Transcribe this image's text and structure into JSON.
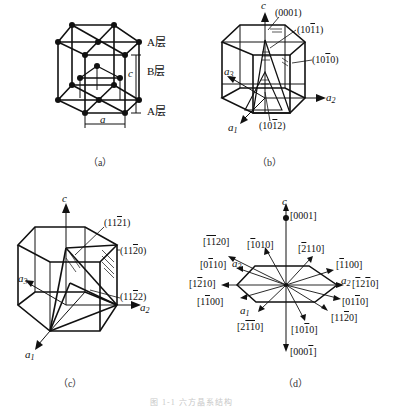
{
  "panels": {
    "a": {
      "caption": "（a）",
      "layers": [
        "A层",
        "B层",
        "A层"
      ],
      "axis_c": "c",
      "axis_a": "a"
    },
    "b": {
      "caption": "（b）",
      "axes": {
        "c": "c",
        "a1": "a",
        "a1_sub": "1",
        "a2": "a",
        "a2_sub": "2",
        "a3": "a",
        "a3_sub": "3"
      },
      "planes": [
        "(0001)",
        "(10̄1̄1)",
        "(101̄0)",
        "(101̄2)"
      ],
      "plane_parts": {
        "p0001": "(0001)",
        "p1011_a": "(10",
        "p1011_b": "1",
        "p1011_c": "1)",
        "p1010_a": "(10",
        "p1010_b": "1",
        "p1010_c": "0)",
        "p1012_a": "(10",
        "p1012_b": "1",
        "p1012_c": "2)"
      }
    },
    "c": {
      "caption": "（c）",
      "axes": {
        "c": "c",
        "a1": "a",
        "a1_sub": "1",
        "a2": "a",
        "a2_sub": "2",
        "a3": "a",
        "a3_sub": "3"
      },
      "plane_parts": {
        "p1121_a": "(11",
        "p1121_b": "2",
        "p1121_c": "1)",
        "p1120_a": "(11",
        "p1120_b": "2",
        "p1120_c": "0)",
        "p1122_a": "(11",
        "p1122_b": "2",
        "p1122_c": "2)"
      }
    },
    "d": {
      "caption": "（d）",
      "axes": {
        "c": "c",
        "a1": "a",
        "a1_sub": "1",
        "a2": "a",
        "a2_sub": "2",
        "a3": "a",
        "a3_sub": "3"
      },
      "directions": [
        {
          "id": "0001",
          "pre": "[0001]",
          "bar": "",
          "post": ""
        },
        {
          "id": "-1-120",
          "pre": "[",
          "bar": "11",
          "post": "20]"
        },
        {
          "id": "-1010",
          "pre": "[",
          "bar": "1",
          "post": "010]"
        },
        {
          "id": "-2110",
          "pre": "[",
          "bar": "2",
          "post": "110]"
        },
        {
          "id": "0-110",
          "pre": "[0",
          "bar": "1",
          "post": "10]"
        },
        {
          "id": "-1100",
          "pre": "[",
          "bar": "1",
          "post": "100]"
        },
        {
          "id": "1-210",
          "pre": "[1",
          "bar": "2",
          "post": "10]"
        },
        {
          "id": "-12-10",
          "pre": "[",
          "bar": "1",
          "post": "2"
        },
        {
          "id": "1-100",
          "pre": "[1",
          "bar": "1",
          "post": "00]"
        },
        {
          "id": "01-10",
          "pre": "[01",
          "bar": "1",
          "post": "0]"
        },
        {
          "id": "2-1-10",
          "pre": "[2",
          "bar": "11",
          "post": "0]"
        },
        {
          "id": "10-10",
          "pre": "[10",
          "bar": "1",
          "post": "0]"
        },
        {
          "id": "11-20",
          "pre": "[11",
          "bar": "2",
          "post": "0]"
        },
        {
          "id": "000-1",
          "pre": "[000",
          "bar": "1",
          "post": "]"
        }
      ]
    }
  },
  "figure_caption": "图 1-1  六方晶系结构"
}
